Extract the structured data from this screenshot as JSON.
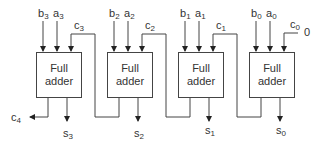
{
  "diagram": {
    "line_color": "#444444",
    "adders": [
      {
        "line1": "Full",
        "line2": "adder",
        "a": "a",
        "b": "b",
        "idx": "3",
        "cin": "c",
        "s": "s"
      },
      {
        "line1": "Full",
        "line2": "adder",
        "a": "a",
        "b": "b",
        "idx": "2",
        "cin": "c",
        "s": "s"
      },
      {
        "line1": "Full",
        "line2": "adder",
        "a": "a",
        "b": "b",
        "idx": "1",
        "cin": "c",
        "s": "s"
      },
      {
        "line1": "Full",
        "line2": "adder",
        "a": "a",
        "b": "b",
        "idx": "0",
        "cin": "c",
        "s": "s"
      }
    ],
    "carry_out": {
      "name": "c",
      "idx": "4"
    },
    "carry_in_value": "0"
  }
}
